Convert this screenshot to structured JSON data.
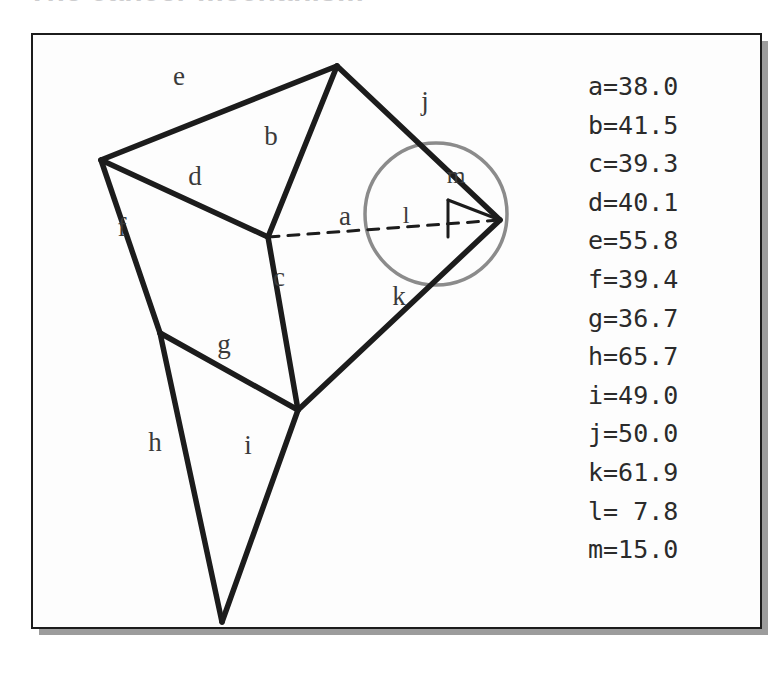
{
  "page": {
    "title": "The cancer mechanism",
    "background_color": "#ffffff"
  },
  "figure": {
    "frame": {
      "border_color": "#1c1c1c",
      "fill_color": "#fdfdfd",
      "shadow_color": "#9c9c9c"
    },
    "stroke_color": "#1c1c1c",
    "circle_color": "#8b8b8b",
    "label_color": "#3a3a3a",
    "circle": {
      "cx": 405,
      "cy": 181,
      "r": 71,
      "name": "construction-circle"
    },
    "vertices": {
      "top": [
        306,
        33
      ],
      "left": [
        70,
        127
      ],
      "center": [
        237,
        204
      ],
      "right": [
        469,
        187
      ],
      "left_mid": [
        129,
        300
      ],
      "lower": [
        267,
        377
      ],
      "bottom": [
        191,
        589
      ],
      "corner": [
        417,
        167
      ]
    },
    "segments": [
      {
        "id": "e",
        "from": "left",
        "to": "top",
        "style": "solid",
        "label_at": [
          148,
          52
        ]
      },
      {
        "id": "b",
        "from": "top",
        "to": "center",
        "style": "solid",
        "label_at": [
          240,
          112
        ]
      },
      {
        "id": "j",
        "from": "top",
        "to": "right",
        "style": "solid",
        "label_at": [
          394,
          77
        ]
      },
      {
        "id": "d",
        "from": "left",
        "to": "center",
        "style": "solid",
        "label_at": [
          164,
          152
        ]
      },
      {
        "id": "f",
        "from": "left",
        "to": "left_mid",
        "style": "solid",
        "label_at": [
          91,
          203
        ]
      },
      {
        "id": "c",
        "from": "center",
        "to": "lower",
        "style": "solid",
        "label_at": [
          248,
          253
        ]
      },
      {
        "id": "a",
        "from": "center",
        "to": "right",
        "style": "dashed",
        "label_at": [
          314,
          192
        ]
      },
      {
        "id": "k",
        "from": "lower",
        "to": "right",
        "style": "solid",
        "label_at": [
          368,
          272
        ]
      },
      {
        "id": "g",
        "from": "left_mid",
        "to": "lower",
        "style": "solid",
        "label_at": [
          193,
          320
        ]
      },
      {
        "id": "h",
        "from": "left_mid",
        "to": "bottom",
        "style": "solid",
        "label_at": [
          124,
          418
        ]
      },
      {
        "id": "i",
        "from": "lower",
        "to": "bottom",
        "style": "solid",
        "label_at": [
          217,
          421
        ]
      },
      {
        "id": "l",
        "from": "corner",
        "to": "corner_down",
        "style": "solid",
        "label_at": [
          375,
          190
        ]
      },
      {
        "id": "m",
        "from": "corner",
        "to": "right",
        "style": "solid",
        "label_at": [
          425,
          150
        ]
      }
    ]
  },
  "legend": {
    "name": "side-length-legend",
    "rows": [
      "a=38.0",
      "b=41.5",
      "c=39.3",
      "d=40.1",
      "e=55.8",
      "f=39.4",
      "g=36.7",
      "h=65.7",
      "i=49.0",
      "j=50.0",
      "k=61.9",
      "l= 7.8",
      "m=15.0"
    ],
    "values": {
      "a": 38.0,
      "b": 41.5,
      "c": 39.3,
      "d": 40.1,
      "e": 55.8,
      "f": 39.4,
      "g": 36.7,
      "h": 65.7,
      "i": 49.0,
      "j": 50.0,
      "k": 61.9,
      "l": 7.8,
      "m": 15.0
    }
  }
}
